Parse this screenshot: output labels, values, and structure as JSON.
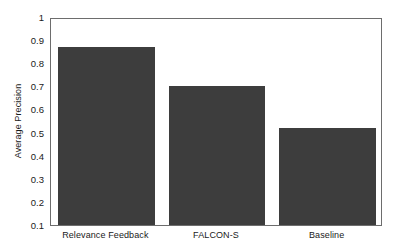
{
  "chart_data": {
    "type": "bar",
    "title": "",
    "xlabel": "",
    "ylabel": "Average Precision",
    "categories": [
      "Relevance Feedback",
      "FALCON-S",
      "Baseline"
    ],
    "values": [
      0.87,
      0.7,
      0.52
    ],
    "ylim": [
      0.1,
      1.0
    ],
    "ytick_labels": [
      "0.1",
      "0.2",
      "0.3",
      "0.4",
      "0.5",
      "0.6",
      "0.7",
      "0.8",
      "0.9",
      "1"
    ],
    "ytick_values": [
      0.1,
      0.2,
      0.3,
      0.4,
      0.5,
      0.6,
      0.7,
      0.8,
      0.9,
      1.0
    ],
    "grid": false,
    "legend": null,
    "bar_color": "#3d3d3d",
    "axis_color": "#6d6d6d",
    "background": "#ffffff"
  }
}
